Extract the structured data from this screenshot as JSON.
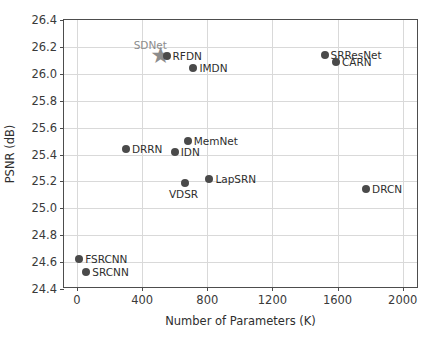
{
  "chart_data": {
    "type": "scatter",
    "title": "",
    "xlabel": "Number of Parameters (K)",
    "ylabel": "PSNR (dB)",
    "xlim": [
      -80,
      2100
    ],
    "ylim": [
      24.4,
      26.4
    ],
    "xticks": [
      0,
      400,
      800,
      1200,
      1600,
      2000
    ],
    "xtick_labels": [
      "0",
      "400",
      "800",
      "1200",
      "1600",
      "2000"
    ],
    "yticks": [
      24.4,
      24.6,
      24.8,
      25.0,
      25.2,
      25.4,
      25.6,
      25.8,
      26.0,
      26.2,
      26.4
    ],
    "ytick_labels": [
      "24.4",
      "24.6",
      "24.8",
      "25.0",
      "25.2",
      "25.4",
      "25.6",
      "25.8",
      "26.0",
      "26.2",
      "26.4"
    ],
    "grid": true,
    "legend": "none",
    "marker_color": "#4a4a4a",
    "highlight_color": "#8c8c8c",
    "points": [
      {
        "name": "SDNet",
        "x": 450,
        "y": 26.14,
        "marker": "star",
        "label_pos": "above",
        "label_color": "gray"
      },
      {
        "name": "RFDN",
        "x": 550,
        "y": 26.13,
        "marker": "circle",
        "label_pos": "right",
        "label_color": "dark"
      },
      {
        "name": "IMDN",
        "x": 715,
        "y": 26.04,
        "marker": "circle",
        "label_pos": "right",
        "label_color": "dark"
      },
      {
        "name": "SRResNet",
        "x": 1520,
        "y": 26.14,
        "marker": "circle",
        "label_pos": "right",
        "label_color": "dark"
      },
      {
        "name": "CARN",
        "x": 1590,
        "y": 26.09,
        "marker": "circle",
        "label_pos": "right",
        "label_color": "dark"
      },
      {
        "name": "MemNet",
        "x": 680,
        "y": 25.5,
        "marker": "circle",
        "label_pos": "right",
        "label_color": "dark"
      },
      {
        "name": "IDN",
        "x": 600,
        "y": 25.42,
        "marker": "circle",
        "label_pos": "right",
        "label_color": "dark"
      },
      {
        "name": "DRRN",
        "x": 300,
        "y": 25.44,
        "marker": "circle",
        "label_pos": "right",
        "label_color": "dark"
      },
      {
        "name": "LapSRN",
        "x": 813,
        "y": 25.22,
        "marker": "circle",
        "label_pos": "right",
        "label_color": "dark"
      },
      {
        "name": "VDSR",
        "x": 665,
        "y": 25.19,
        "marker": "circle",
        "label_pos": "belowleft",
        "label_color": "dark"
      },
      {
        "name": "DRCN",
        "x": 1775,
        "y": 25.14,
        "marker": "circle",
        "label_pos": "right",
        "label_color": "dark"
      },
      {
        "name": "FSRCNN",
        "x": 13,
        "y": 24.62,
        "marker": "circle",
        "label_pos": "right",
        "label_color": "dark"
      },
      {
        "name": "SRCNN",
        "x": 57,
        "y": 24.53,
        "marker": "circle",
        "label_pos": "right",
        "label_color": "dark"
      }
    ]
  }
}
